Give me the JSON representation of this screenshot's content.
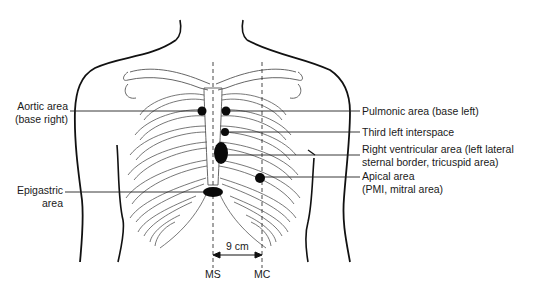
{
  "figure": {
    "colors": {
      "ink": "#111111",
      "line": "#222222",
      "bone": "#555555",
      "background": "#ffffff"
    }
  },
  "labels": {
    "aortic": {
      "line1": "Aortic area",
      "line2": "(base right)"
    },
    "epigastric": {
      "line1": "Epigastric",
      "line2": "area"
    },
    "pulmonic": {
      "line1": "Pulmonic area (base left)"
    },
    "third_left": {
      "line1": "Third left interspace"
    },
    "right_ventricular": {
      "line1": "Right ventricular area (left lateral",
      "line2": "sternal border, tricuspid area)"
    },
    "apical": {
      "line1": "Apical area",
      "line2": "(PMI, mitral area)"
    }
  },
  "measurement": {
    "distance": "9 cm",
    "left_marker": "MS",
    "right_marker": "MC"
  }
}
